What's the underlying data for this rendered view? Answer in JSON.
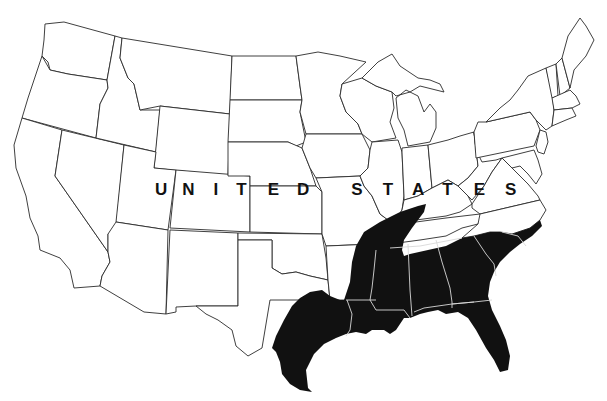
{
  "map": {
    "type": "outline map",
    "region": "Contiguous United States",
    "label_letters": [
      "U",
      "N",
      "I",
      "T",
      "E",
      "D",
      " ",
      "S",
      "T",
      "A",
      "T",
      "E",
      "S"
    ],
    "label_text": "UNITED STATES",
    "shaded_region": {
      "description": "Gulf Coast / Southeastern states",
      "color": "#111111",
      "states_included": [
        "Texas (east/coastal)",
        "Louisiana",
        "Arkansas (south)",
        "Mississippi",
        "Alabama",
        "Georgia",
        "Florida",
        "South Carolina",
        "North Carolina (east)",
        "Tennessee (west, Mississippi River corridor)",
        "Kentucky (west tip)"
      ]
    },
    "colors": {
      "background": "#ffffff",
      "state_fill": "#ffffff",
      "state_border": "#2a2a2a",
      "shaded_fill": "#111111",
      "shaded_internal_border": "#d8d8d8"
    }
  }
}
